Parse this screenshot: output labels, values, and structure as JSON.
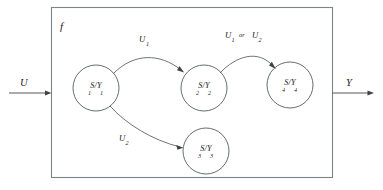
{
  "figure": {
    "block_label": "f",
    "input_label": "U",
    "output_label": "Y"
  },
  "nodes": [
    {
      "id": "state-1",
      "main": "S/Y",
      "sub_left": "1",
      "sub_right": "1",
      "cx": 96,
      "cy": 88,
      "r": 23
    },
    {
      "id": "state-2",
      "main": "S/Y",
      "sub_left": "2",
      "sub_right": "2",
      "cx": 204,
      "cy": 88,
      "r": 23
    },
    {
      "id": "state-3",
      "main": "S/Y",
      "sub_left": "3",
      "sub_right": "3",
      "cx": 206,
      "cy": 151,
      "r": 23
    },
    {
      "id": "state-4",
      "main": "S/Y",
      "sub_left": "4",
      "sub_right": "4",
      "cx": 290,
      "cy": 85,
      "r": 23
    }
  ],
  "edges": [
    {
      "id": "edge-1-to-2",
      "from": "state-1",
      "to": "state-2",
      "label_main": "U",
      "label_sub": "1",
      "label_or": "",
      "label_main2": "",
      "label_sub2": ""
    },
    {
      "id": "edge-2-to-4",
      "from": "state-2",
      "to": "state-4",
      "label_main": "U",
      "label_sub": "1",
      "label_or": "or",
      "label_main2": "U",
      "label_sub2": "2"
    },
    {
      "id": "edge-1-to-3",
      "from": "state-1",
      "to": "state-3",
      "label_main": "U",
      "label_sub": "2",
      "label_or": "",
      "label_main2": "",
      "label_sub2": ""
    }
  ],
  "icons": {
    "input_arrow": "arrow-right-icon",
    "output_arrow": "arrow-right-icon",
    "transition_arrow": "arrowhead-icon"
  },
  "colors": {
    "stroke": "#555a5e",
    "box_stroke": "#7e8387",
    "text": "#1a1a1a",
    "background": "#ffffff"
  }
}
